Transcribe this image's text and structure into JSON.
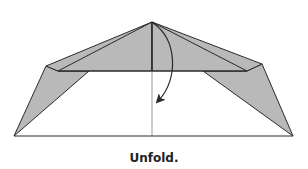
{
  "diagram": {
    "type": "origami-step",
    "caption": "Unfold.",
    "colors": {
      "shade": "#b9b9b9",
      "line": "#2a2a2a",
      "background": "#ffffff"
    },
    "elements": [
      "apex-point",
      "upper-left-flap",
      "upper-right-flap",
      "lower-left-flap",
      "lower-right-flap",
      "center-fold-line",
      "horizontal-fold-line",
      "base-line",
      "unfold-arrow"
    ]
  }
}
